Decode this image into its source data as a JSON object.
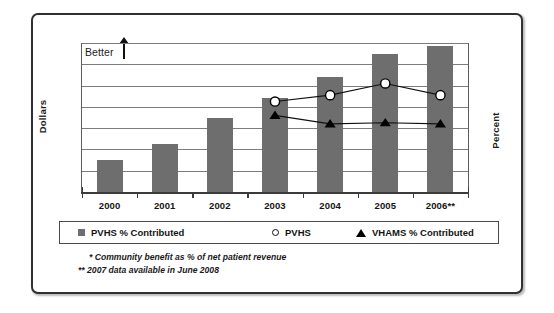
{
  "annotations": {
    "better_label": "Better",
    "better_arrow_icon": "arrow-up-icon"
  },
  "axes": {
    "left_title": "Dollars",
    "right_title": "Percent"
  },
  "legend": {
    "items": [
      {
        "label": "PVHS % Contributed",
        "marker": "square",
        "color": "#6e6e6e"
      },
      {
        "label": "PVHS",
        "marker": "circle",
        "color": "#ffffff"
      },
      {
        "label": "VHAMS % Contributed",
        "marker": "triangle",
        "color": "#000000"
      }
    ]
  },
  "footnotes": [
    "* Community benefit as % of net patient revenue",
    "** 2007 data available in June 2008"
  ],
  "chart_data": {
    "type": "bar",
    "title": "",
    "subtitle": "",
    "xlabel": "",
    "ylabel": "Dollars",
    "y2label": "Percent",
    "grid": true,
    "gridlines": 8,
    "legend_position": "bottom",
    "categories": [
      "2000",
      "2001",
      "2002",
      "2003",
      "2004",
      "2005",
      "2006**"
    ],
    "ylim": [
      0,
      7
    ],
    "series": [
      {
        "name": "PVHS % Contributed",
        "type": "bar",
        "axis": "left",
        "color": "#6e6e6e",
        "values": [
          1.5,
          2.25,
          3.5,
          4.4,
          5.4,
          6.5,
          6.85
        ]
      },
      {
        "name": "PVHS",
        "type": "line",
        "axis": "right",
        "marker": "circle",
        "color": "#ffffff",
        "values": [
          null,
          null,
          null,
          4.25,
          4.55,
          5.1,
          4.55
        ]
      },
      {
        "name": "VHAMS % Contributed",
        "type": "line",
        "axis": "right",
        "marker": "triangle",
        "color": "#000000",
        "values": [
          null,
          null,
          null,
          3.6,
          3.2,
          3.25,
          3.2
        ]
      }
    ]
  }
}
